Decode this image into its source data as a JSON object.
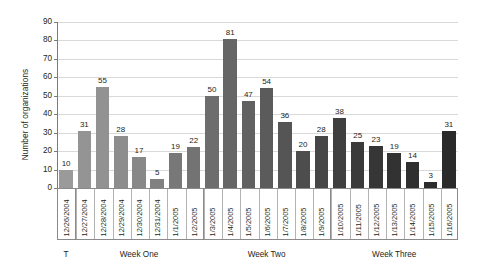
{
  "chart_data": {
    "type": "bar",
    "title": "",
    "xlabel": "",
    "ylabel": "Number of organizations",
    "ylim": [
      0,
      90
    ],
    "ytick_step": 10,
    "yticks": [
      0,
      10,
      20,
      30,
      40,
      50,
      60,
      70,
      80,
      90
    ],
    "grid": true,
    "legend": "none",
    "categories": [
      "12/26/2004",
      "12/27/2004",
      "12/28/2004",
      "12/29/2004",
      "12/30/2004",
      "12/31/2004",
      "1/1/2005",
      "1/2/2005",
      "1/3/2005",
      "1/4/2005",
      "1/5/2005",
      "1/6/2005",
      "1/7/2005",
      "1/8/2005",
      "1/9/2005",
      "1/10/2005",
      "1/11/2005",
      "1/12/2005",
      "1/13/2005",
      "1/14/2005",
      "1/15/2005",
      "1/16/2005"
    ],
    "values": [
      10,
      31,
      55,
      28,
      17,
      5,
      19,
      22,
      50,
      81,
      47,
      54,
      36,
      20,
      28,
      38,
      25,
      23,
      19,
      14,
      3,
      31
    ],
    "bar_colors": [
      "#9a9a9a",
      "#949494",
      "#929292",
      "#8d8d8d",
      "#888888",
      "#818181",
      "#787878",
      "#737373",
      "#6d6d6d",
      "#666666",
      "#616161",
      "#5b5b5b",
      "#555555",
      "#4d4d4d",
      "#464646",
      "#3f3f3f",
      "#3a3a3a",
      "#363636",
      "#323232",
      "#2f2f2f",
      "#2c2c2c",
      "#2a2a2a"
    ],
    "groups": [
      {
        "label": "T",
        "start": 0,
        "end": 0
      },
      {
        "label": "Week One",
        "start": 1,
        "end": 7
      },
      {
        "label": "Week Two",
        "start": 8,
        "end": 14
      },
      {
        "label": "Week Three",
        "start": 15,
        "end": 21
      }
    ],
    "colors": {
      "gridline": "#d9d9d9",
      "axis": "#7b7b7b",
      "text": "#231f20",
      "label_box_border": "#8a8a8a",
      "background": "#ffffff"
    }
  }
}
